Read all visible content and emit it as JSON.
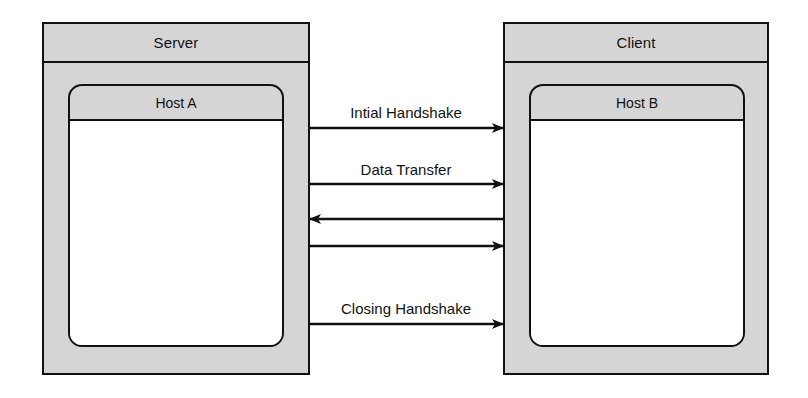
{
  "diagram": {
    "line_color": "#111111",
    "fill_color": "#d5d5d5",
    "body_color": "#ffffff"
  },
  "nodes": [
    {
      "id": "server",
      "label": "Server",
      "host_label": "Host A",
      "x": 42,
      "y": 22,
      "width": 268,
      "height": 353
    },
    {
      "id": "client",
      "label": "Client",
      "host_label": "Host B",
      "x": 503,
      "y": 22,
      "width": 266,
      "height": 353
    }
  ],
  "messages": [
    {
      "id": "initial-handshake",
      "label": "Intial Handshake",
      "direction": "right",
      "y": 128
    },
    {
      "id": "data-transfer",
      "label": "Data Transfer",
      "direction": "right",
      "y": 184
    },
    {
      "id": "data-response",
      "label": "",
      "direction": "left",
      "y": 219
    },
    {
      "id": "data-request",
      "label": "",
      "direction": "right",
      "y": 246
    },
    {
      "id": "closing-handshake",
      "label": "Closing Handshake",
      "direction": "right",
      "y": 324
    }
  ],
  "channel": {
    "x_start": 310,
    "x_end": 503
  }
}
